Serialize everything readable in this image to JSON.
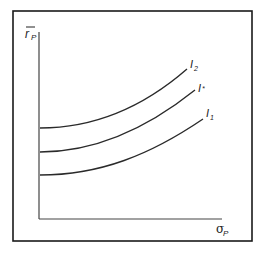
{
  "diagram": {
    "y_axis_label": "r̄P",
    "y_axis_main": "r",
    "y_axis_sub": "P",
    "x_axis_label": "σP",
    "x_axis_main": "σ",
    "x_axis_sub": "P",
    "curves": [
      {
        "name": "I2",
        "main": "I",
        "sub": "2"
      },
      {
        "name": "I*",
        "main": "I",
        "sub": "*"
      },
      {
        "name": "I1",
        "main": "I",
        "sub": "1"
      }
    ],
    "colors": {
      "line": "#2a2a2a",
      "frame": "#1a1a1a",
      "background": "#ffffff"
    }
  }
}
